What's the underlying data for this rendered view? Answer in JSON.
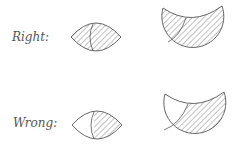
{
  "figure": {
    "rows": [
      {
        "label": "Right:",
        "lens": {
          "shading": "fully hatched",
          "divider": "curve near center"
        },
        "crescent": {
          "shading": "fully hatched",
          "divider": "curve on upper-left"
        }
      },
      {
        "label": "Wrong:",
        "lens": {
          "shading": "left part unshaded, right part hatched",
          "divider": "curve near center"
        },
        "crescent": {
          "shading": "upper-left part unshaded, rest hatched",
          "divider": "curve on upper-left"
        }
      }
    ],
    "colors": {
      "stroke": "#555555",
      "hatch": "#666666",
      "background": "#ffffff"
    }
  }
}
